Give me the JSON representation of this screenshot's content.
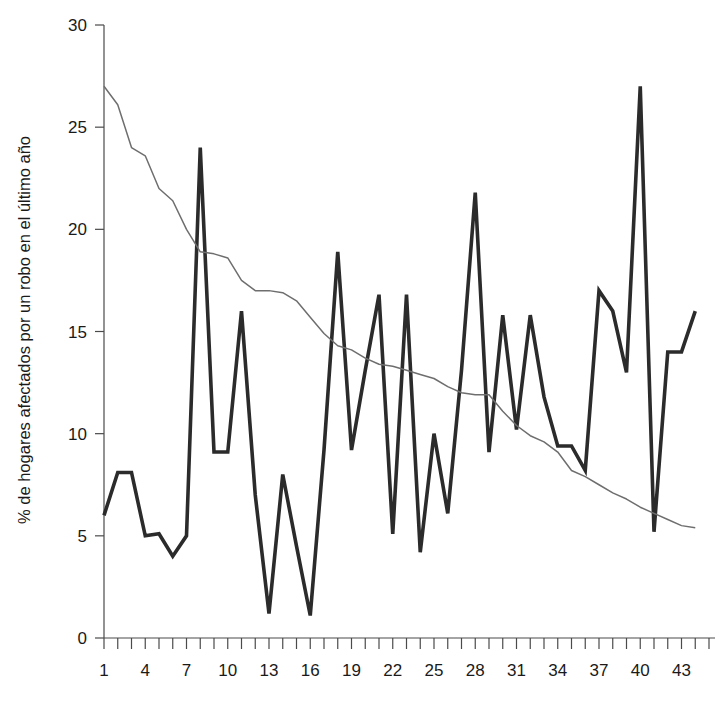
{
  "chart_data": {
    "type": "line",
    "title": "",
    "subtitle": "",
    "xlabel": "",
    "ylabel": "% de hogares afectados por un robo en el último año",
    "xlim": [
      1,
      45
    ],
    "ylim": [
      0,
      30
    ],
    "grid": false,
    "legend": false,
    "legend_position": "none",
    "y_ticks": [
      0,
      5,
      10,
      15,
      20,
      25,
      30
    ],
    "y_tick_labels": [
      "0",
      "5",
      "10",
      "15",
      "20",
      "25",
      "30"
    ],
    "x_ticks": [
      1,
      2,
      3,
      4,
      5,
      6,
      7,
      8,
      9,
      10,
      11,
      12,
      13,
      14,
      15,
      16,
      17,
      18,
      19,
      20,
      21,
      22,
      23,
      24,
      25,
      26,
      27,
      28,
      29,
      30,
      31,
      32,
      33,
      34,
      35,
      36,
      37,
      38,
      39,
      40,
      41,
      42,
      43,
      44,
      45
    ],
    "x_tick_labels": [
      "1",
      "4",
      "7",
      "10",
      "13",
      "16",
      "19",
      "22",
      "25",
      "28",
      "31",
      "34",
      "37",
      "40",
      "43"
    ],
    "x_tick_label_values": [
      1,
      4,
      7,
      10,
      13,
      16,
      19,
      22,
      25,
      28,
      31,
      34,
      37,
      40,
      43
    ],
    "x": [
      1,
      2,
      3,
      4,
      5,
      6,
      7,
      8,
      9,
      10,
      11,
      12,
      13,
      14,
      15,
      16,
      17,
      18,
      19,
      20,
      21,
      22,
      23,
      24,
      25,
      26,
      27,
      28,
      29,
      30,
      31,
      32,
      33,
      34,
      35,
      36,
      37,
      38,
      39,
      40,
      41,
      42,
      43,
      44
    ],
    "series": [
      {
        "name": "serie-gruesa",
        "color": "#2b2b2b",
        "width": 3.6,
        "values": [
          6,
          8.1,
          8.1,
          5,
          5.1,
          4,
          5,
          24,
          9.1,
          9.1,
          16,
          7,
          1.2,
          8,
          4.5,
          1.1,
          9.2,
          18.9,
          9.2,
          13.1,
          16.8,
          5.1,
          16.8,
          4.2,
          10,
          6.1,
          13.1,
          21.8,
          9.1,
          15.8,
          10.2,
          15.8,
          11.8,
          9.4,
          9.4,
          8.2,
          17,
          16,
          13,
          27,
          5.2,
          14,
          14,
          16
        ]
      },
      {
        "name": "serie-fina",
        "color": "#6e6e6e",
        "width": 1.5,
        "values": [
          27,
          26.1,
          24,
          23.6,
          22,
          21.4,
          20,
          18.9,
          18.8,
          18.6,
          17.5,
          17,
          17,
          16.9,
          16.5,
          15.7,
          14.9,
          14.3,
          14.1,
          13.7,
          13.4,
          13.3,
          13.1,
          12.9,
          12.7,
          12.3,
          12,
          11.9,
          11.9,
          11.1,
          10.4,
          9.9,
          9.6,
          9.1,
          8.2,
          7.9,
          7.5,
          7.1,
          6.8,
          6.4,
          6.1,
          5.8,
          5.5,
          5.4
        ]
      }
    ]
  },
  "axis": {
    "y_title": "% de hogares afectados por un robo en el último año"
  }
}
